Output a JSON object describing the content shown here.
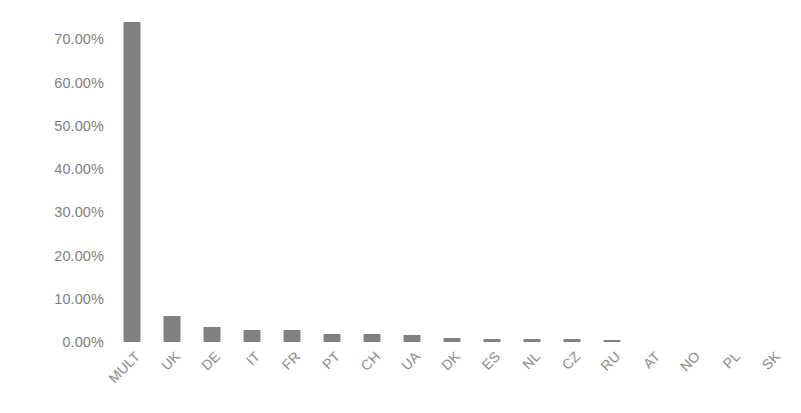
{
  "chart_data": {
    "type": "bar",
    "title": "",
    "subtitle": "",
    "xlabel": "",
    "ylabel": "",
    "categories": [
      "MULT",
      "UK",
      "DE",
      "IT",
      "FR",
      "PT",
      "CH",
      "UA",
      "DK",
      "ES",
      "NL",
      "CZ",
      "RU",
      "AT",
      "NO",
      "PL",
      "SK"
    ],
    "values": [
      73.9,
      6.0,
      3.5,
      2.8,
      2.75,
      1.9,
      1.8,
      1.7,
      0.9,
      0.8,
      0.7,
      0.6,
      0.55,
      0.0,
      0.0,
      0.0,
      0.0
    ],
    "value_labels": [
      "73.90%",
      "6.00%",
      "3.50%",
      "2.80%",
      "2.75%",
      "1.90%",
      "1.80%",
      "1.70%",
      "0.90%",
      "0.80%",
      "0.70%",
      "0.60%",
      "0.55%",
      "0.00%",
      "0.00%",
      "0.00%",
      "0.00%"
    ],
    "ylim": [
      0,
      74
    ],
    "y_ticks": [
      0,
      10,
      20,
      30,
      40,
      50,
      60,
      70
    ],
    "y_tick_labels": [
      "0.00%",
      "10.00%",
      "20.00%",
      "30.00%",
      "40.00%",
      "50.00%",
      "60.00%",
      "70.00%"
    ],
    "grid": false,
    "legend": "none",
    "series": [
      {
        "name": "Share",
        "values": [
          73.9,
          6.0,
          3.5,
          2.8,
          2.75,
          1.9,
          1.8,
          1.7,
          0.9,
          0.8,
          0.7,
          0.6,
          0.55,
          0.0,
          0.0,
          0.0,
          0.0
        ]
      }
    ],
    "colors": {
      "bar": "#808080",
      "tick_label": "#7f7f7f",
      "category_label": "#8c8c8c",
      "background": "#ffffff"
    }
  }
}
